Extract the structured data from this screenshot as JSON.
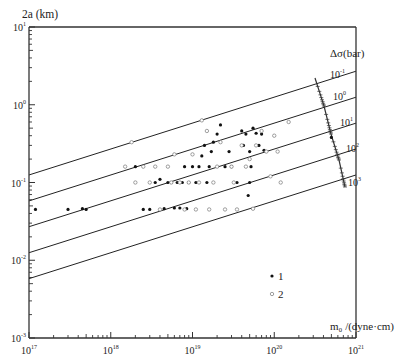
{
  "chart_data": {
    "type": "scatter",
    "title": "",
    "xlabel": "m₀ /(dyne·cm)",
    "ylabel": "2a (km)",
    "xscale": "log",
    "yscale": "log",
    "xlim": [
      1e+17,
      1e+21
    ],
    "ylim": [
      0.001,
      10
    ],
    "grid": false,
    "x_ticks": [
      {
        "value": 1e+17,
        "label": "10",
        "exp": "17"
      },
      {
        "value": 1e+18,
        "label": "10",
        "exp": "18"
      },
      {
        "value": 1e+19,
        "label": "10",
        "exp": "19"
      },
      {
        "value": 1e+20,
        "label": "10",
        "exp": "20"
      },
      {
        "value": 1e+21,
        "label": "10",
        "exp": "21"
      }
    ],
    "y_ticks": [
      {
        "value": 0.001,
        "label": "10",
        "exp": "-3"
      },
      {
        "value": 0.01,
        "label": "10",
        "exp": "-2"
      },
      {
        "value": 0.1,
        "label": "10",
        "exp": "-1"
      },
      {
        "value": 1,
        "label": "10",
        "exp": "0"
      },
      {
        "value": 10,
        "label": "10",
        "exp": "1"
      }
    ],
    "stress_drop_lines": {
      "label": "Δσ(bar)",
      "lines": [
        {
          "delta_sigma": 0.1,
          "label": "10",
          "exp": "-1",
          "y_at_xmin": 0.125,
          "y_at_xmax": 2.7
        },
        {
          "delta_sigma": 1,
          "label": "10",
          "exp": "0",
          "y_at_xmin": 0.058,
          "y_at_xmax": 1.25
        },
        {
          "delta_sigma": 10,
          "label": "10",
          "exp": "1",
          "y_at_xmin": 0.027,
          "y_at_xmax": 0.58
        },
        {
          "delta_sigma": 100,
          "label": "10",
          "exp": "2",
          "y_at_xmin": 0.0125,
          "y_at_xmax": 0.27
        },
        {
          "delta_sigma": 1000,
          "label": "10",
          "exp": "3",
          "y_at_xmin": 0.0058,
          "y_at_xmax": 0.125
        }
      ]
    },
    "legend": {
      "position": "lower right",
      "entries": [
        {
          "label": "1",
          "marker": "filled-circle"
        },
        {
          "label": "2",
          "marker": "open-circle"
        }
      ]
    },
    "series": [
      {
        "name": "1",
        "marker": "filled-circle",
        "points": [
          [
            1.2e+17,
            0.045
          ],
          [
            3e+17,
            0.045
          ],
          [
            4.5e+17,
            0.046
          ],
          [
            5e+17,
            0.045
          ],
          [
            2e+18,
            0.16
          ],
          [
            2.5e+18,
            0.045
          ],
          [
            3e+18,
            0.045
          ],
          [
            3.5e+18,
            0.1
          ],
          [
            4e+18,
            0.11
          ],
          [
            4.5e+18,
            0.046
          ],
          [
            5e+18,
            0.1
          ],
          [
            5.5e+18,
            0.1
          ],
          [
            6e+18,
            0.047
          ],
          [
            6.5e+18,
            0.1
          ],
          [
            7e+18,
            0.047
          ],
          [
            7.5e+18,
            0.1
          ],
          [
            8e+18,
            0.16
          ],
          [
            8.5e+18,
            0.046
          ],
          [
            9e+18,
            0.1
          ],
          [
            1e+19,
            0.16
          ],
          [
            1.1e+19,
            0.1
          ],
          [
            1.2e+19,
            0.16
          ],
          [
            1.3e+19,
            0.22
          ],
          [
            1.4e+19,
            0.3
          ],
          [
            1.5e+19,
            0.1
          ],
          [
            1.6e+19,
            0.16
          ],
          [
            1.7e+19,
            0.25
          ],
          [
            1.8e+19,
            0.33
          ],
          [
            2e+19,
            0.42
          ],
          [
            2.2e+19,
            0.55
          ],
          [
            2.5e+19,
            0.16
          ],
          [
            2.8e+19,
            0.25
          ],
          [
            3e+19,
            0.16
          ],
          [
            3.5e+19,
            0.1
          ],
          [
            4e+19,
            0.46
          ],
          [
            4.2e+19,
            0.3
          ],
          [
            4.5e+19,
            0.42
          ],
          [
            5e+19,
            0.25
          ],
          [
            5.2e+19,
            0.16
          ],
          [
            5.5e+19,
            0.5
          ],
          [
            6e+19,
            0.43
          ],
          [
            6.5e+19,
            0.3
          ],
          [
            7e+19,
            0.42
          ],
          [
            7.5e+19,
            0.26
          ],
          [
            5e+19,
            0.1
          ],
          [
            4.8e+19,
            0.068
          ],
          [
            5e+20,
            0.38
          ]
        ]
      },
      {
        "name": "2",
        "marker": "open-circle",
        "points": [
          [
            1.5e+18,
            0.16
          ],
          [
            1.8e+18,
            0.33
          ],
          [
            2e+18,
            0.1
          ],
          [
            2.5e+18,
            0.16
          ],
          [
            3e+18,
            0.1
          ],
          [
            3.5e+18,
            0.16
          ],
          [
            4e+18,
            0.045
          ],
          [
            5e+18,
            0.16
          ],
          [
            5.5e+18,
            0.1
          ],
          [
            6e+18,
            0.23
          ],
          [
            7e+18,
            0.1
          ],
          [
            8e+18,
            0.045
          ],
          [
            9e+18,
            0.1
          ],
          [
            1e+19,
            0.23
          ],
          [
            1.1e+19,
            0.045
          ],
          [
            1.2e+19,
            0.1
          ],
          [
            1.5e+19,
            0.46
          ],
          [
            1.6e+19,
            0.045
          ],
          [
            1.8e+19,
            0.1
          ],
          [
            2e+19,
            0.16
          ],
          [
            2.2e+19,
            0.33
          ],
          [
            2.5e+19,
            0.045
          ],
          [
            3e+19,
            0.16
          ],
          [
            3.2e+19,
            0.1
          ],
          [
            3.5e+19,
            0.045
          ],
          [
            4e+19,
            0.3
          ],
          [
            4.5e+19,
            0.16
          ],
          [
            5e+19,
            0.2
          ],
          [
            5.5e+19,
            0.046
          ],
          [
            6e+19,
            0.3
          ],
          [
            7e+19,
            0.46
          ],
          [
            8e+19,
            0.25
          ],
          [
            9e+19,
            0.12
          ],
          [
            1e+20,
            0.4
          ],
          [
            1.1e+20,
            0.25
          ],
          [
            1.2e+20,
            0.1
          ],
          [
            1.3e+19,
            0.63
          ],
          [
            1.5e+20,
            0.6
          ]
        ]
      }
    ]
  }
}
